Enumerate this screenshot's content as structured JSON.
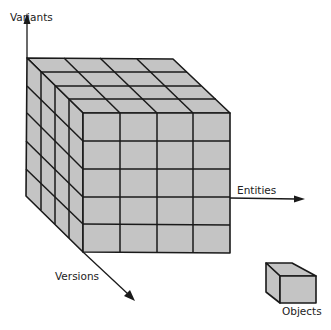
{
  "diagram": {
    "type": "data-cube",
    "grid": {
      "divisions_per_axis": 4,
      "rows_on_front": 5
    },
    "axes": {
      "vertical": {
        "label": "Variants"
      },
      "horizontal": {
        "label": "Entities"
      },
      "depth": {
        "label": "Versions"
      }
    },
    "legend": {
      "label": "Objects",
      "meaning": "single cell / object"
    },
    "colors": {
      "face": "#c4c4c4",
      "line": "#1a1a1a",
      "background": "#ffffff"
    }
  }
}
